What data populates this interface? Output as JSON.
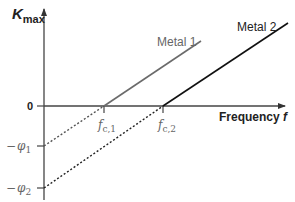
{
  "diagram": {
    "y_axis": {
      "label_main": "K",
      "label_sub": "max"
    },
    "x_axis": {
      "label": "Frequency ",
      "label_var": "f",
      "origin_label": "0"
    },
    "series": [
      {
        "name": "Metal 1",
        "color": "#6b6b6b",
        "cutoff_label_main": "f",
        "cutoff_label_sub": "c,1",
        "intercept_label_sign": "−",
        "intercept_label_main": "φ",
        "intercept_label_sub": "1"
      },
      {
        "name": "Metal 2",
        "color": "#111111",
        "cutoff_label_main": "f",
        "cutoff_label_sub": "c,2",
        "intercept_label_sign": "−",
        "intercept_label_main": "φ",
        "intercept_label_sub": "2"
      }
    ]
  }
}
